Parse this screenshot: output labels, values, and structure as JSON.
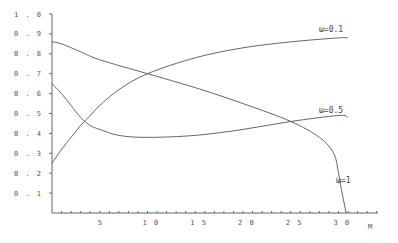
{
  "chart_data": {
    "type": "line",
    "title": "",
    "xlabel": "M",
    "ylabel": "",
    "xlim": [
      0,
      35
    ],
    "ylim": [
      0,
      1.0
    ],
    "grid": false,
    "legend": "inline labels at curve ends",
    "x_ticks": [
      "5",
      "10",
      "15",
      "20",
      "25",
      "30"
    ],
    "y_ticks": [
      "0.1",
      "0.2",
      "0.3",
      "0.4",
      "0.5",
      "0.6",
      "0.7",
      "0.8",
      "0.9",
      "1.0"
    ],
    "series": [
      {
        "name": "ω=0.1",
        "label": "ω=0.1",
        "x": [
          0,
          1,
          2,
          3,
          4,
          5,
          7,
          10,
          15,
          20,
          25,
          30,
          31
        ],
        "values": [
          0.25,
          0.32,
          0.38,
          0.44,
          0.49,
          0.54,
          0.62,
          0.7,
          0.78,
          0.83,
          0.86,
          0.88,
          0.88
        ]
      },
      {
        "name": "ω=0.5",
        "label": "ω=0.5",
        "x": [
          0,
          1,
          2,
          3,
          4,
          5,
          7,
          10,
          15,
          20,
          25,
          30,
          31
        ],
        "values": [
          0.65,
          0.6,
          0.54,
          0.48,
          0.44,
          0.42,
          0.39,
          0.38,
          0.39,
          0.42,
          0.46,
          0.49,
          0.48
        ]
      },
      {
        "name": "ω=1",
        "label": "ω=1",
        "x": [
          0,
          1,
          3,
          5,
          10,
          15,
          20,
          25,
          28,
          29.5,
          30,
          30.3,
          30.8
        ],
        "values": [
          0.86,
          0.85,
          0.81,
          0.77,
          0.7,
          0.63,
          0.55,
          0.46,
          0.38,
          0.3,
          0.2,
          0.12,
          0.0
        ]
      }
    ]
  },
  "axes": {
    "x_label": "M",
    "y_tick_labels": [
      "1.0",
      "0.9",
      "0.8",
      "0.7",
      "0.6",
      "0.5",
      "0.4",
      "0.3",
      "0.2",
      "0.1"
    ],
    "x_tick_labels": [
      "5",
      "10",
      "15",
      "20",
      "25",
      "30"
    ]
  },
  "labels": {
    "w01": "ω=0.1",
    "w05": "ω=0.5",
    "w1": "ω=1"
  }
}
